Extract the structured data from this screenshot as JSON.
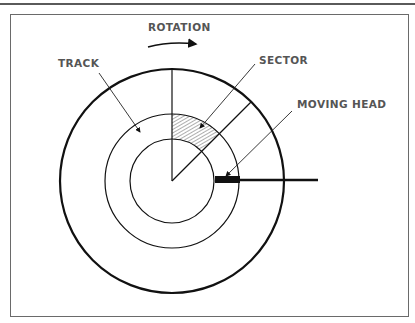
{
  "diagram": {
    "labels": {
      "rotation": "ROTATION",
      "track": "TRACK",
      "sector": "SECTOR",
      "moving_head": "MOVING HEAD"
    },
    "colors": {
      "line": "#111111",
      "label": "#555555",
      "frame": "#6a6a6a"
    }
  }
}
